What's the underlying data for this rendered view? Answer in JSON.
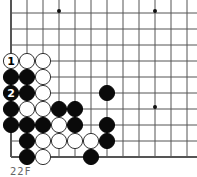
{
  "diagram": {
    "type": "go-board-corner",
    "grid": {
      "origin_x": 11,
      "origin_y": 13,
      "spacing": 16,
      "cols": 12,
      "rows": 10,
      "left_edge": true,
      "bottom_edge": true
    },
    "star_points": [
      [
        3,
        0
      ],
      [
        9,
        0
      ],
      [
        9,
        6
      ]
    ],
    "stones": [
      {
        "c": 0,
        "r": 3,
        "color": "white",
        "label": "1"
      },
      {
        "c": 1,
        "r": 3,
        "color": "white"
      },
      {
        "c": 2,
        "r": 3,
        "color": "white"
      },
      {
        "c": 0,
        "r": 4,
        "color": "black"
      },
      {
        "c": 1,
        "r": 4,
        "color": "black"
      },
      {
        "c": 2,
        "r": 4,
        "color": "white"
      },
      {
        "c": 0,
        "r": 5,
        "color": "black",
        "label": "2"
      },
      {
        "c": 1,
        "r": 5,
        "color": "black"
      },
      {
        "c": 2,
        "r": 5,
        "color": "white"
      },
      {
        "c": 6,
        "r": 5,
        "color": "black"
      },
      {
        "c": 0,
        "r": 6,
        "color": "black"
      },
      {
        "c": 1,
        "r": 6,
        "color": "white"
      },
      {
        "c": 2,
        "r": 6,
        "color": "white"
      },
      {
        "c": 3,
        "r": 6,
        "color": "black"
      },
      {
        "c": 4,
        "r": 6,
        "color": "black"
      },
      {
        "c": 0,
        "r": 7,
        "color": "black"
      },
      {
        "c": 1,
        "r": 7,
        "color": "black"
      },
      {
        "c": 2,
        "r": 7,
        "color": "black"
      },
      {
        "c": 3,
        "r": 7,
        "color": "white"
      },
      {
        "c": 4,
        "r": 7,
        "color": "black"
      },
      {
        "c": 6,
        "r": 7,
        "color": "black"
      },
      {
        "c": 1,
        "r": 8,
        "color": "black"
      },
      {
        "c": 2,
        "r": 8,
        "color": "white"
      },
      {
        "c": 3,
        "r": 8,
        "color": "white"
      },
      {
        "c": 4,
        "r": 8,
        "color": "white"
      },
      {
        "c": 5,
        "r": 8,
        "color": "white"
      },
      {
        "c": 6,
        "r": 8,
        "color": "black"
      },
      {
        "c": 1,
        "r": 9,
        "color": "black"
      },
      {
        "c": 2,
        "r": 9,
        "color": "white"
      },
      {
        "c": 5,
        "r": 9,
        "color": "black"
      }
    ],
    "caption": "22F"
  }
}
